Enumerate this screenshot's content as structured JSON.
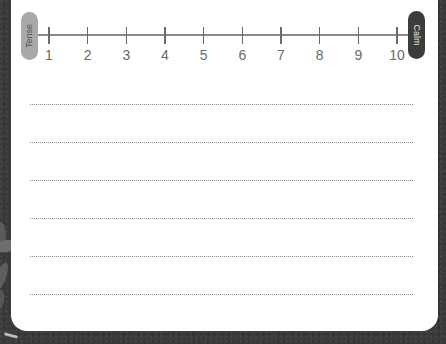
{
  "scale": {
    "left_label": "Tense",
    "right_label": "Calm",
    "ticks": [
      "1",
      "2",
      "3",
      "4",
      "5",
      "6",
      "7",
      "8",
      "9",
      "10"
    ],
    "left_color": "#a9a9a9",
    "right_color": "#3c3c3c"
  },
  "writing_lines": {
    "count": 6
  },
  "background": {
    "color": "#3a3a3a"
  }
}
